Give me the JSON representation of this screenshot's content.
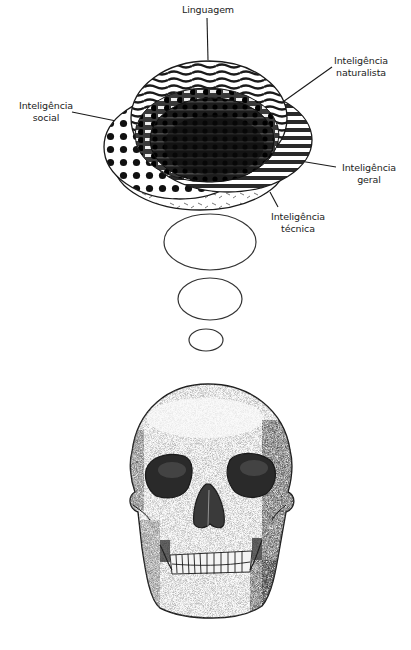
{
  "diagram": {
    "type": "mind-model-illustration",
    "labels": {
      "language": {
        "line1": "Linguagem"
      },
      "social": {
        "line1": "Inteligência",
        "line2": "social"
      },
      "naturalist": {
        "line1": "Inteligência",
        "line2": "naturalista"
      },
      "general": {
        "line1": "Inteligência",
        "line2": "geral"
      },
      "technical": {
        "line1": "Inteligência",
        "line2": "técnica"
      }
    },
    "components": [
      "Linguagem ellipse (wavy horizontal lines)",
      "Inteligência social ellipse (dots)",
      "Inteligência naturalista ellipse (horizontal stripes)",
      "Inteligência geral (dark center overlap)",
      "Inteligência técnica ellipse (dashes)",
      "Three empty ellipses decreasing in size (thought bubbles)",
      "Stippled human skull (frontal view)"
    ],
    "colors": {
      "ink": "#1a1a1a",
      "background": "#ffffff",
      "stipple": "#333333"
    }
  }
}
